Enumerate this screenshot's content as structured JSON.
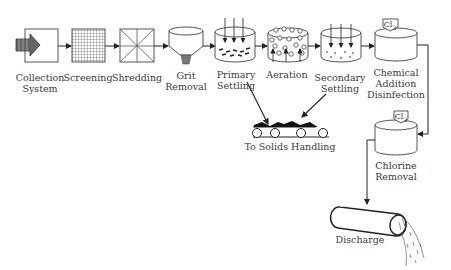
{
  "diagram": {
    "stages": [
      {
        "id": "collection",
        "label_line1": "Collection",
        "label_line2": "System",
        "icon": "arrow-in-box-icon"
      },
      {
        "id": "screening",
        "label_line1": "Screening",
        "label_line2": "",
        "icon": "grid-screen-icon"
      },
      {
        "id": "shredding",
        "label_line1": "Shredding",
        "label_line2": "",
        "icon": "shredder-icon"
      },
      {
        "id": "grit",
        "label_line1": "Grit",
        "label_line2": "Removal",
        "icon": "hopper-icon"
      },
      {
        "id": "primary",
        "label_line1": "Primary",
        "label_line2": "Settling",
        "icon": "settling-tank-icon"
      },
      {
        "id": "aeration",
        "label_line1": "Aeration",
        "label_line2": "",
        "icon": "aeration-tank-icon"
      },
      {
        "id": "secondary",
        "label_line1": "Secondary",
        "label_line2": "Settling",
        "icon": "settling-tank-icon"
      },
      {
        "id": "chemical",
        "label_line1": "Chemical",
        "label_line2": "Addition",
        "label_line3": "Disinfection",
        "icon": "tank-icon",
        "badge": "Cl2"
      },
      {
        "id": "chlorine",
        "label_line1": "Chlorine",
        "label_line2": "Removal",
        "icon": "tank-icon",
        "badge": "Cl2"
      },
      {
        "id": "discharge",
        "label_line1": "Discharge",
        "label_line2": "",
        "icon": "pipe-outfall-icon"
      }
    ],
    "solids": {
      "label": "To Solids Handling",
      "icon": "conveyor-icon"
    },
    "badge_text": "Cl",
    "badge_sub": "2"
  }
}
